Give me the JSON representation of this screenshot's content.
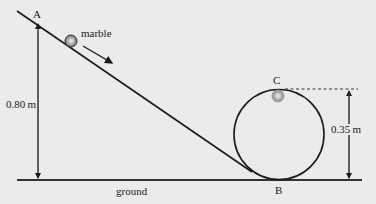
{
  "diagram": {
    "labels": {
      "point_a": "A",
      "point_b": "B",
      "point_c": "C",
      "marble": "marble",
      "height_a": "0.80 m",
      "height_c": "0.35 m",
      "ground": "ground"
    },
    "colors": {
      "background": "#ebebeb",
      "line": "#1a1a1a",
      "marble": "#8a8a8a"
    },
    "values": {
      "height_a_m": 0.8,
      "height_c_m": 0.35
    }
  }
}
